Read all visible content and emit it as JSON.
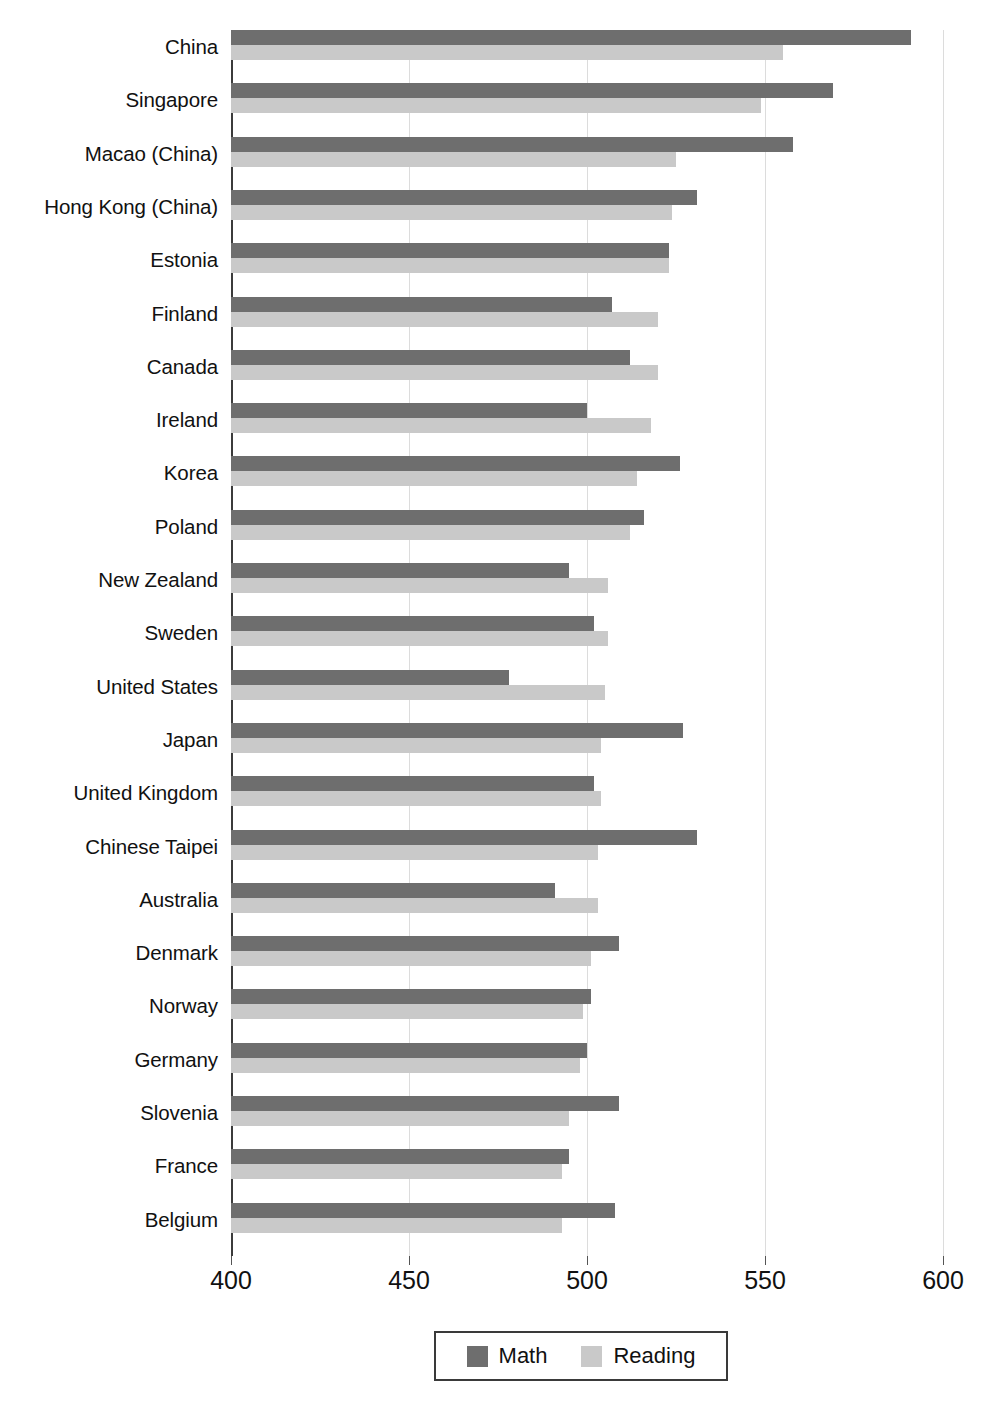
{
  "chart_data": {
    "type": "bar",
    "orientation": "horizontal",
    "title": "",
    "subtitle": "",
    "xlabel": "",
    "ylabel": "",
    "xlim": [
      400,
      600
    ],
    "xticks": [
      400,
      450,
      500,
      550,
      600
    ],
    "xtick_labels": [
      "400",
      "450",
      "500",
      "550",
      "600"
    ],
    "grid": true,
    "grid_axis": "x",
    "legend_position": "bottom-center",
    "categories": [
      "China",
      "Singapore",
      "Macao (China)",
      "Hong Kong (China)",
      "Estonia",
      "Finland",
      "Canada",
      "Ireland",
      "Korea",
      "Poland",
      "New Zealand",
      "Sweden",
      "United States",
      "Japan",
      "United Kingdom",
      "Chinese Taipei",
      "Australia",
      "Denmark",
      "Norway",
      "Germany",
      "Slovenia",
      "France",
      "Belgium"
    ],
    "series": [
      {
        "name": "Math",
        "color": "#6e6e6e",
        "values": [
          591,
          569,
          558,
          531,
          523,
          507,
          512,
          500,
          526,
          516,
          495,
          502,
          478,
          527,
          502,
          531,
          491,
          509,
          501,
          500,
          509,
          495,
          508
        ]
      },
      {
        "name": "Reading",
        "color": "#c9c9c9",
        "values": [
          555,
          549,
          525,
          524,
          523,
          520,
          520,
          518,
          514,
          512,
          506,
          506,
          505,
          504,
          504,
          503,
          503,
          501,
          499,
          498,
          495,
          493,
          493
        ]
      }
    ]
  },
  "legend": {
    "entries": [
      {
        "label": "Math",
        "color": "#6e6e6e",
        "swatch_name": "legend-swatch-math"
      },
      {
        "label": "Reading",
        "color": "#c9c9c9",
        "swatch_name": "legend-swatch-reading"
      }
    ]
  }
}
